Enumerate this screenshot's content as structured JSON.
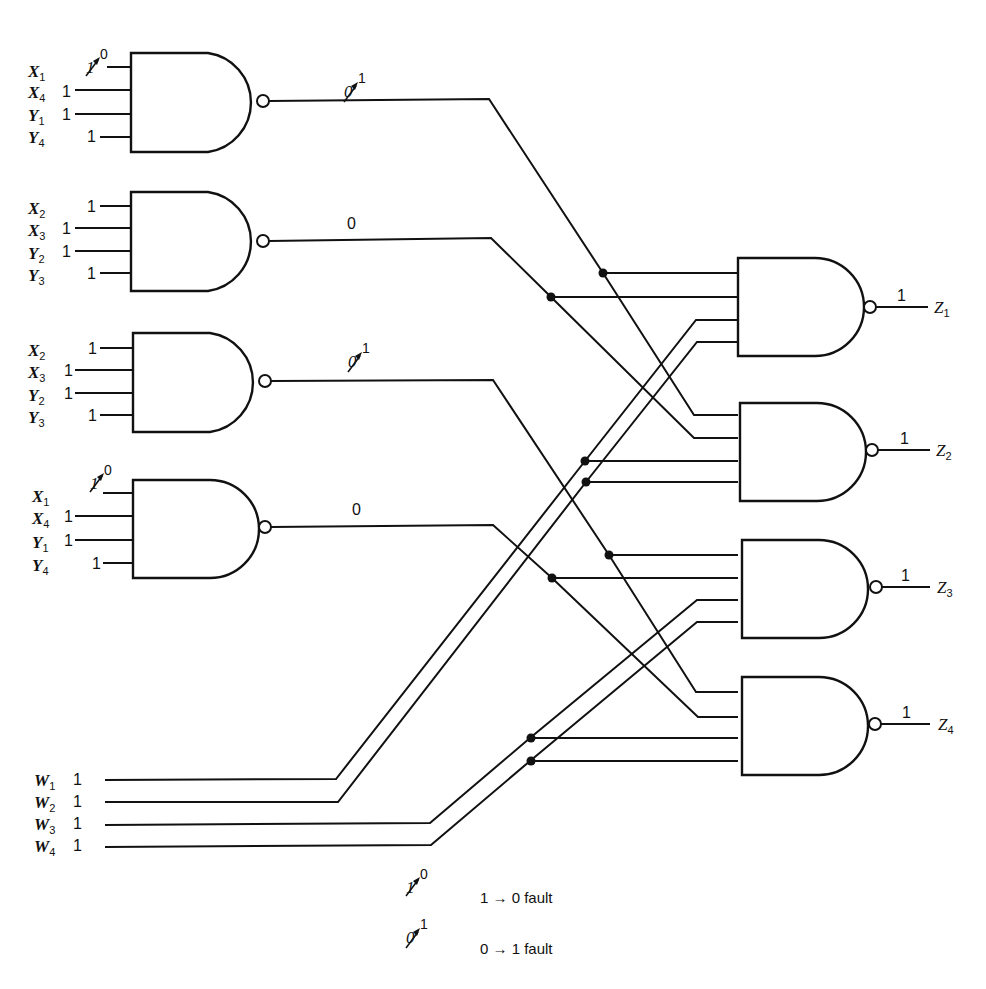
{
  "diagram": {
    "type": "logic-circuit"
  },
  "input_gates": [
    {
      "id": "G1",
      "inputs": [
        {
          "name": "X",
          "sub": "1",
          "value": "1",
          "fault": "1→0",
          "fault_to": "0"
        },
        {
          "name": "X",
          "sub": "4",
          "value": "1"
        },
        {
          "name": "Y",
          "sub": "1",
          "value": "1"
        },
        {
          "name": "Y",
          "sub": "4",
          "value": "1"
        }
      ],
      "output_value": "0",
      "output_fault": "0→1",
      "output_fault_to": "1"
    },
    {
      "id": "G2",
      "inputs": [
        {
          "name": "X",
          "sub": "2",
          "value": "1"
        },
        {
          "name": "X",
          "sub": "3",
          "value": "1"
        },
        {
          "name": "Y",
          "sub": "2",
          "value": "1"
        },
        {
          "name": "Y",
          "sub": "3",
          "value": "1"
        }
      ],
      "output_value": "0"
    },
    {
      "id": "G3",
      "inputs": [
        {
          "name": "X",
          "sub": "2",
          "value": "1"
        },
        {
          "name": "X",
          "sub": "3",
          "value": "1"
        },
        {
          "name": "Y",
          "sub": "2",
          "value": "1"
        },
        {
          "name": "Y",
          "sub": "3",
          "value": "1"
        }
      ],
      "output_value": "0",
      "output_fault": "0→1",
      "output_fault_to": "1"
    },
    {
      "id": "G4",
      "inputs": [
        {
          "name": "X",
          "sub": "1",
          "value": "1",
          "fault": "1→0",
          "fault_to": "0"
        },
        {
          "name": "X",
          "sub": "4",
          "value": "1"
        },
        {
          "name": "Y",
          "sub": "1",
          "value": "1"
        },
        {
          "name": "Y",
          "sub": "4",
          "value": "1"
        }
      ],
      "output_value": "0"
    }
  ],
  "w_inputs": [
    {
      "name": "W",
      "sub": "1",
      "value": "1"
    },
    {
      "name": "W",
      "sub": "2",
      "value": "1"
    },
    {
      "name": "W",
      "sub": "3",
      "value": "1"
    },
    {
      "name": "W",
      "sub": "4",
      "value": "1"
    }
  ],
  "output_gates": [
    {
      "id": "Z1",
      "name": "Z",
      "sub": "1",
      "value": "1",
      "inputs": [
        "G1",
        "G2",
        "W1",
        "W2"
      ]
    },
    {
      "id": "Z2",
      "name": "Z",
      "sub": "2",
      "value": "1",
      "inputs": [
        "G1",
        "G2",
        "W1",
        "W2"
      ]
    },
    {
      "id": "Z3",
      "name": "Z",
      "sub": "3",
      "value": "1",
      "inputs": [
        "G3",
        "G4",
        "W3",
        "W4"
      ]
    },
    {
      "id": "Z4",
      "name": "Z",
      "sub": "4",
      "value": "1",
      "inputs": [
        "G3",
        "G4",
        "W3",
        "W4"
      ]
    }
  ],
  "legend": [
    {
      "symbol_base": "1",
      "symbol_sup": "0",
      "text": "1 → 0  fault"
    },
    {
      "symbol_base": "0",
      "symbol_sup": "1",
      "text": "0 → 1  fault"
    }
  ]
}
